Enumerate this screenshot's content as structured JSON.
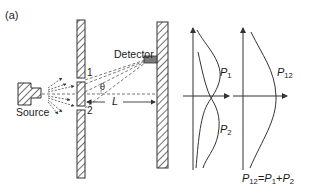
{
  "figure": {
    "panel_label": "(a)",
    "source_label": "Source",
    "detector_label": "Detector",
    "slit_1_label": "1",
    "slit_2_label": "2",
    "angle_label": "θ",
    "distance_label": "L",
    "graph_left": {
      "curve_1": {
        "base": "P",
        "sub": "1"
      },
      "curve_2": {
        "base": "P",
        "sub": "2"
      }
    },
    "graph_right": {
      "curve": {
        "base": "P",
        "sub": "12"
      },
      "equation": {
        "lhs_base": "P",
        "lhs_sub": "12",
        "eq": "=",
        "t1_base": "P",
        "t1_sub": "1",
        "plus": "+",
        "t2_base": "P",
        "t2_sub": "2"
      }
    }
  },
  "colors": {
    "line": "#333333",
    "dashed": "#555555",
    "detector_fill": "#7a7a7a"
  }
}
